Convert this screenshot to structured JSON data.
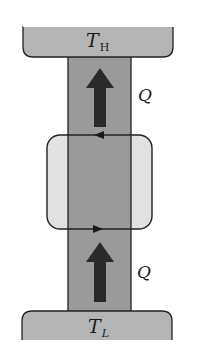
{
  "diagram": {
    "hot_reservoir": {
      "symbol": "T",
      "subscript": "H"
    },
    "cold_reservoir": {
      "symbol": "T",
      "subscript": "L"
    },
    "heat_top": {
      "label": "Q"
    },
    "heat_bottom": {
      "label": "Q"
    },
    "cycle": {
      "top_arrow_direction": "left",
      "bottom_arrow_direction": "right"
    },
    "colors": {
      "reservoir_fill": "#b4b4b4",
      "column_fill": "#9a9a9a",
      "cycle_fill": "#e2e2e2",
      "arrow_fill": "#2a2a2a",
      "outline": "#222222",
      "background": "#ffffff"
    }
  }
}
